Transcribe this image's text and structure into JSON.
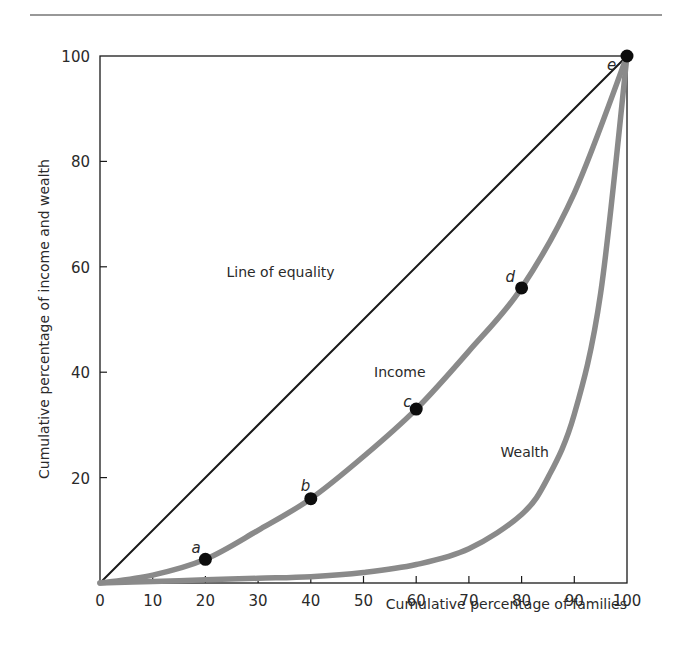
{
  "chart_data": {
    "type": "line",
    "title": "",
    "xlabel": "Cumulative percentage of families",
    "ylabel": "Cumulative percentage of income and wealth",
    "xlim": [
      0,
      100
    ],
    "ylim": [
      0,
      100
    ],
    "x_ticks": [
      0,
      10,
      20,
      30,
      40,
      50,
      60,
      70,
      80,
      90,
      100
    ],
    "y_ticks": [
      20,
      40,
      60,
      80,
      100
    ],
    "grid": false,
    "legend": "none (inline annotations)",
    "series": [
      {
        "name": "Line of equality",
        "color": "#1a1a1a",
        "x": [
          0,
          100
        ],
        "values": [
          0,
          100
        ]
      },
      {
        "name": "Income",
        "color": "#8a8a8a",
        "x": [
          0,
          10,
          20,
          30,
          40,
          50,
          60,
          70,
          80,
          90,
          100
        ],
        "values": [
          0,
          1.5,
          4.5,
          10,
          16,
          24,
          33,
          44,
          56,
          74,
          100
        ]
      },
      {
        "name": "Wealth",
        "color": "#8a8a8a",
        "x": [
          0,
          10,
          20,
          30,
          40,
          50,
          60,
          70,
          80,
          85,
          90,
          95,
          100
        ],
        "values": [
          0,
          0.3,
          0.6,
          0.9,
          1.2,
          2,
          3.5,
          6.5,
          13,
          20,
          32,
          55,
          100
        ]
      }
    ],
    "points": [
      {
        "label": "a",
        "x": 20,
        "y": 4.5
      },
      {
        "label": "b",
        "x": 40,
        "y": 16
      },
      {
        "label": "c",
        "x": 60,
        "y": 33
      },
      {
        "label": "d",
        "x": 80,
        "y": 56
      },
      {
        "label": "e",
        "x": 100,
        "y": 100
      }
    ],
    "annotations": [
      {
        "text": "Line of equality",
        "x": 24,
        "y": 58
      },
      {
        "text": "Income",
        "x": 52,
        "y": 39
      },
      {
        "text": "Wealth",
        "x": 76,
        "y": 24
      }
    ]
  },
  "labels": {
    "xlabel": "Cumulative percentage of families",
    "ylabel": "Cumulative percentage of income and wealth",
    "equality": "Line of equality",
    "income": "Income",
    "wealth": "Wealth"
  }
}
